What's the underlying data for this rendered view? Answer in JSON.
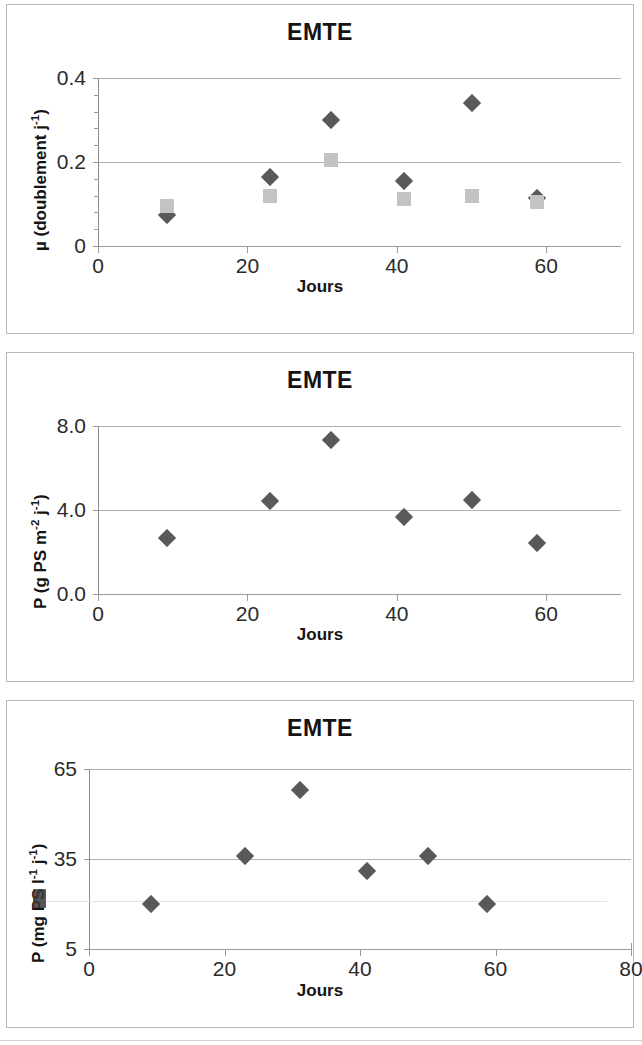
{
  "page": {
    "background": "#ffffff",
    "marker_diamond_color": "#595959",
    "marker_square_color": "#c3c3c3",
    "gridline_color": "#b0b0b0",
    "axis_color": "#8c8c8c"
  },
  "panels": [
    {
      "id": "panel-1",
      "title": "EMTE",
      "xlabel": "Jours",
      "ylabel_html": "µ (doublement j<sup>-1</sup>)",
      "ylabel_text": "µ (doublement j-1)",
      "yticks": [
        "0",
        "0.2",
        "0.4"
      ],
      "xticks": [
        "0",
        "20",
        "40",
        "60"
      ]
    },
    {
      "id": "panel-2",
      "title": "EMTE",
      "xlabel": "Jours",
      "ylabel_html": "P (g PS m<sup>-2</sup> j<sup>-1</sup>)",
      "ylabel_text": "P (g PS m-2 j-1)",
      "yticks": [
        "0.0",
        "4.0",
        "8.0"
      ],
      "xticks": [
        "0",
        "20",
        "40",
        "60"
      ]
    },
    {
      "id": "panel-3",
      "title": "EMTE",
      "xlabel": "Jours",
      "ylabel_html": "P (mg PS l<sup>-1</sup> j<sup>-1</sup>)",
      "ylabel_text": "P (mg PS l-1 j-1)",
      "yticks": [
        "5",
        "35",
        "65"
      ],
      "xticks": [
        "0",
        "20",
        "40",
        "60",
        "80"
      ]
    }
  ],
  "chart_data": [
    {
      "type": "scatter",
      "title": "EMTE",
      "xlabel": "Jours",
      "ylabel": "µ (doublement j-1)",
      "xlim": [
        0,
        70
      ],
      "ylim": [
        0,
        0.4
      ],
      "xticks": [
        0,
        20,
        40,
        60
      ],
      "yticks": [
        0,
        0.2,
        0.4
      ],
      "grid": true,
      "legend": "none",
      "series": [
        {
          "name": "diamond",
          "marker": "diamond",
          "color": "#595959",
          "x": [
            9.2,
            23.0,
            31.2,
            41.0,
            50.0,
            58.8
          ],
          "y": [
            0.075,
            0.165,
            0.3,
            0.155,
            0.34,
            0.115
          ]
        },
        {
          "name": "square",
          "marker": "square",
          "color": "#c3c3c3",
          "x": [
            9.2,
            23.0,
            31.2,
            41.0,
            50.0,
            58.8
          ],
          "y": [
            0.095,
            0.12,
            0.205,
            0.112,
            0.12,
            0.105
          ]
        }
      ]
    },
    {
      "type": "scatter",
      "title": "EMTE",
      "xlabel": "Jours",
      "ylabel": "P (g PS m-2 j-1)",
      "xlim": [
        0,
        70
      ],
      "ylim": [
        0.0,
        8.0
      ],
      "xticks": [
        0,
        20,
        40,
        60
      ],
      "yticks": [
        0.0,
        4.0,
        8.0
      ],
      "grid": true,
      "legend": "none",
      "series": [
        {
          "name": "diamond",
          "marker": "diamond",
          "color": "#595959",
          "x": [
            9.2,
            23.0,
            31.2,
            41.0,
            50.0,
            58.8
          ],
          "y": [
            2.65,
            4.45,
            7.35,
            3.65,
            4.5,
            2.45
          ]
        }
      ]
    },
    {
      "type": "scatter",
      "title": "EMTE",
      "xlabel": "Jours",
      "ylabel": "P (mg PS l-1 j-1)",
      "xlim": [
        0,
        80
      ],
      "ylim": [
        5,
        65
      ],
      "xticks": [
        0,
        20,
        40,
        60,
        80
      ],
      "yticks": [
        5,
        35,
        65
      ],
      "grid": true,
      "legend": "none",
      "series": [
        {
          "name": "diamond",
          "marker": "diamond",
          "color": "#595959",
          "x": [
            9.2,
            23.0,
            31.2,
            41.0,
            50.0,
            58.8
          ],
          "y": [
            20.0,
            36.0,
            58.0,
            31.0,
            36.0,
            20.0
          ]
        }
      ]
    }
  ]
}
